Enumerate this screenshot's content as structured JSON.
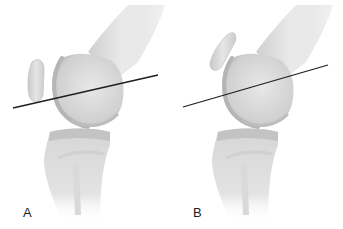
{
  "figure": {
    "colors": {
      "bone_light": "#e4e4e4",
      "bone_mid": "#cfcfcf",
      "bone_dark": "#a9a9a9",
      "line": "#1e1e1e",
      "background": "#ffffff"
    },
    "panels": [
      {
        "label": "A",
        "label_pos": [
          24,
          218
        ],
        "line": {
          "x1": 13,
          "y1": 108,
          "x2": 158,
          "y2": 75
        },
        "patella": "tall upright oval, anterior to femoral condyle"
      },
      {
        "label": "B",
        "label_pos": [
          193,
          218
        ],
        "line": {
          "x1": 183,
          "y1": 107,
          "x2": 328,
          "y2": 65
        },
        "patella": "tilted oval, higher position"
      }
    ]
  }
}
